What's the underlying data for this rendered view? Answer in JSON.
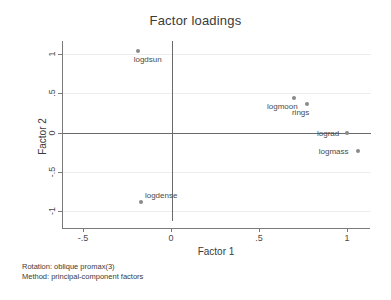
{
  "chart_data": {
    "type": "scatter",
    "title": "Factor loadings",
    "xlabel": "Factor 1",
    "ylabel": "Factor 2",
    "xlim": [
      -0.62,
      1.13
    ],
    "ylim": [
      -1.13,
      1.17
    ],
    "xticks": [
      -0.5,
      0,
      0.5,
      1
    ],
    "xtick_labels": [
      "-.5",
      "0",
      ".5",
      "1"
    ],
    "yticks": [
      1,
      0.5,
      0,
      -0.5,
      -1
    ],
    "ytick_labels": [
      "1",
      ".5",
      "0",
      "-.5",
      "-1"
    ],
    "grid": true,
    "legend": "none",
    "points": [
      {
        "label": "logdsun",
        "x": -0.19,
        "y": 1.04,
        "label_dx": 10,
        "label_dy": 8
      },
      {
        "label": "logmoon",
        "x": 0.7,
        "y": 0.44,
        "label_dx": -12,
        "label_dy": 8
      },
      {
        "label": "rings",
        "x": 0.77,
        "y": 0.37,
        "label_dx": -6,
        "label_dy": 8
      },
      {
        "label": "lograd",
        "x": 1.0,
        "y": 0.0,
        "label_dx": -19,
        "label_dy": 0
      },
      {
        "label": "logmass",
        "x": 1.06,
        "y": -0.23,
        "label_dx": -24,
        "label_dy": 0
      },
      {
        "label": "logdense",
        "x": -0.17,
        "y": -0.89,
        "label_dx": 20,
        "label_dy": -7
      }
    ],
    "annotations": [
      "Rotation: oblique promax(3)",
      "Method: principal-component factors"
    ],
    "marker_color": "#8a8a8a",
    "axis_color": "#6a6a6a",
    "grid_color": "#ededed"
  }
}
